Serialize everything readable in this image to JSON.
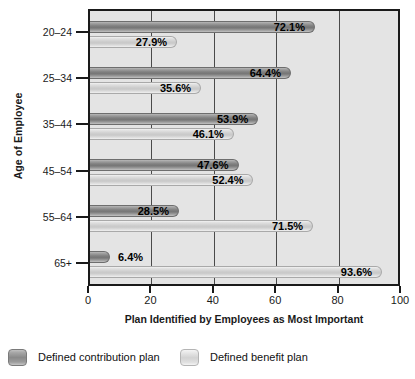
{
  "chart_data": {
    "type": "bar",
    "orientation": "horizontal",
    "title": "",
    "xlabel": "Plan Identified by Employees as Most Important",
    "ylabel": "Age of Employee",
    "categories": [
      "20–24",
      "25–34",
      "35–44",
      "45–54",
      "55–64",
      "65+"
    ],
    "series": [
      {
        "name": "Defined contribution plan",
        "color": "#7f7f7f",
        "values": [
          72.1,
          64.4,
          53.9,
          47.6,
          28.5,
          6.4
        ],
        "labels": [
          "72.1%",
          "64.4%",
          "53.9%",
          "47.6%",
          "28.5%",
          "6.4%"
        ]
      },
      {
        "name": "Defined benefit plan",
        "color": "#cfcfcf",
        "values": [
          27.9,
          35.6,
          46.1,
          52.4,
          71.5,
          93.6
        ],
        "labels": [
          "27.9%",
          "35.6%",
          "46.1%",
          "52.4%",
          "71.5%",
          "93.6%"
        ]
      }
    ],
    "xlim": [
      0,
      100
    ],
    "xticks": [
      0,
      20,
      40,
      60,
      80,
      100
    ],
    "xtick_labels": [
      "0",
      "20",
      "40",
      "60",
      "80",
      "100"
    ],
    "grid": true,
    "grid_axis": "x",
    "legend_position": "bottom",
    "plot_background": "#e4e4e4",
    "axis_color": "#1a1a1a"
  },
  "legend": {
    "items": [
      {
        "label": "Defined contribution plan",
        "swatch": "dark"
      },
      {
        "label": "Defined benefit plan",
        "swatch": "light"
      }
    ]
  }
}
